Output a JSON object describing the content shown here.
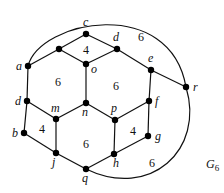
{
  "graph": {
    "name": "G",
    "name_subscript": "6",
    "name_pos": [
      206,
      168
    ],
    "vertices": [
      {
        "id": "c",
        "label": "c",
        "x": 86,
        "y": 34,
        "lx": 83,
        "ly": 26
      },
      {
        "id": "u",
        "label": "",
        "x": 59,
        "y": 49,
        "lx": 0,
        "ly": 0
      },
      {
        "id": "a",
        "label": "a",
        "x": 28,
        "y": 66,
        "lx": 16,
        "ly": 70
      },
      {
        "id": "o",
        "label": "o",
        "x": 86,
        "y": 64,
        "lx": 91,
        "ly": 73
      },
      {
        "id": "d1",
        "label": "d",
        "x": 117,
        "y": 49,
        "lx": 113,
        "ly": 41
      },
      {
        "id": "e",
        "label": "e",
        "x": 151,
        "y": 70,
        "lx": 148,
        "ly": 62
      },
      {
        "id": "r",
        "label": "r",
        "x": 186,
        "y": 87,
        "lx": 193,
        "ly": 91
      },
      {
        "id": "f",
        "label": "f",
        "x": 149,
        "y": 101,
        "lx": 155,
        "ly": 105
      },
      {
        "id": "n",
        "label": "n",
        "x": 86,
        "y": 103,
        "lx": 82,
        "ly": 116
      },
      {
        "id": "m",
        "label": "m",
        "x": 56,
        "y": 119,
        "lx": 51,
        "ly": 112
      },
      {
        "id": "p",
        "label": "p",
        "x": 115,
        "y": 120,
        "lx": 111,
        "ly": 112
      },
      {
        "id": "d2",
        "label": "d",
        "x": 27,
        "y": 101,
        "lx": 15,
        "ly": 105
      },
      {
        "id": "b",
        "label": "b",
        "x": 24,
        "y": 133,
        "lx": 12,
        "ly": 137
      },
      {
        "id": "g",
        "label": "g",
        "x": 148,
        "y": 136,
        "lx": 155,
        "ly": 140
      },
      {
        "id": "j",
        "label": "j",
        "x": 56,
        "y": 153,
        "lx": 52,
        "ly": 166
      },
      {
        "id": "h",
        "label": "h",
        "x": 114,
        "y": 154,
        "lx": 113,
        "ly": 167
      },
      {
        "id": "q",
        "label": "q",
        "x": 86,
        "y": 169,
        "lx": 82,
        "ly": 182
      }
    ],
    "edges": [
      [
        "a",
        "u"
      ],
      [
        "u",
        "c"
      ],
      [
        "c",
        "d1"
      ],
      [
        "u",
        "o"
      ],
      [
        "d1",
        "o"
      ],
      [
        "d1",
        "e"
      ],
      [
        "e",
        "r"
      ],
      [
        "e",
        "f"
      ],
      [
        "o",
        "n"
      ],
      [
        "a",
        "d2"
      ],
      [
        "d2",
        "m"
      ],
      [
        "d2",
        "b"
      ],
      [
        "b",
        "j"
      ],
      [
        "m",
        "j"
      ],
      [
        "m",
        "n"
      ],
      [
        "n",
        "p"
      ],
      [
        "p",
        "f"
      ],
      [
        "f",
        "g"
      ],
      [
        "p",
        "h"
      ],
      [
        "g",
        "h"
      ],
      [
        "j",
        "q"
      ],
      [
        "h",
        "q"
      ]
    ],
    "arcs": [
      {
        "from": "a",
        "to": "r",
        "path": "M28,66 C40,20 170,-5 186,87"
      },
      {
        "from": "r",
        "to": "q",
        "path": "M186,87 C205,150 150,200 86,169"
      }
    ],
    "face_labels": [
      {
        "text": "4",
        "x": 86,
        "y": 54
      },
      {
        "text": "6",
        "x": 141,
        "y": 41
      },
      {
        "text": "6",
        "x": 58,
        "y": 86
      },
      {
        "text": "6",
        "x": 116,
        "y": 90
      },
      {
        "text": "4",
        "x": 42,
        "y": 133
      },
      {
        "text": "6",
        "x": 86,
        "y": 148
      },
      {
        "text": "4",
        "x": 133,
        "y": 135
      },
      {
        "text": "6",
        "x": 152,
        "y": 167
      }
    ]
  }
}
